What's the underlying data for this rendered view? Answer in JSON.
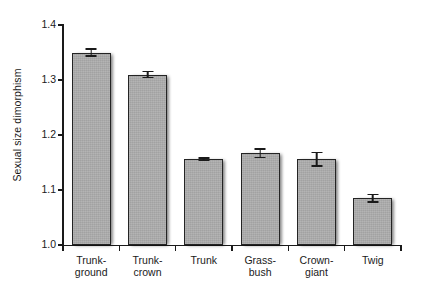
{
  "chart_data": {
    "type": "bar",
    "title": "",
    "xlabel": "",
    "ylabel": "Sexual size dimorphism",
    "categories": [
      "Trunk-ground",
      "Trunk-crown",
      "Trunk",
      "Grass-bush",
      "Crown-giant",
      "Twig"
    ],
    "category_lines": [
      [
        "Trunk-",
        "ground"
      ],
      [
        "Trunk-",
        "crown"
      ],
      [
        "Trunk",
        ""
      ],
      [
        "Grass-",
        "bush"
      ],
      [
        "Crown-",
        "giant"
      ],
      [
        "Twig",
        ""
      ]
    ],
    "values": [
      1.35,
      1.31,
      1.156,
      1.167,
      1.156,
      1.085
    ],
    "errors": [
      0.008,
      0.007,
      0.004,
      0.009,
      0.014,
      0.008
    ],
    "ylim": [
      1.0,
      1.4
    ],
    "yticks": [
      1.0,
      1.1,
      1.2,
      1.3,
      1.4
    ],
    "ytick_labels": [
      "1.0",
      "1.1",
      "1.2",
      "1.3",
      "1.4"
    ],
    "grid": false,
    "legend": "none",
    "bar_color": "#ababab",
    "bar_edge_color": "#242424",
    "axis_color": "#1a1a1a",
    "error_bar_color": "#1a1a1a",
    "background": "#ffffff"
  }
}
